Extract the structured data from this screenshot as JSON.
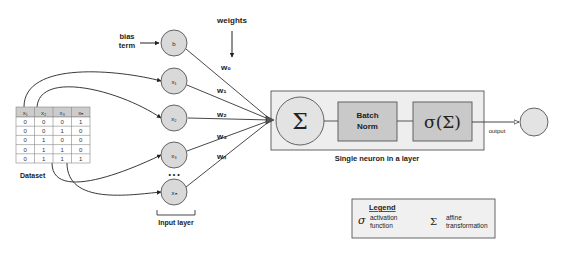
{
  "labels": {
    "weights": "weights",
    "bias_line1": "bias",
    "bias_line2": "term",
    "dataset": "Dataset",
    "input_layer": "Input layer",
    "neuron_caption": "Single neuron in a layer",
    "output": "output",
    "ellipsis": "• • •"
  },
  "input_nodes": [
    {
      "id": "b",
      "label": "b"
    },
    {
      "id": "x1",
      "label": "x₁"
    },
    {
      "id": "x2",
      "label": "x₂"
    },
    {
      "id": "x3",
      "label": "x₃"
    },
    {
      "id": "xn",
      "label": "xₙ"
    }
  ],
  "weights": [
    "w₀",
    "w₁",
    "w₂",
    "w₃",
    "wₙ"
  ],
  "neuron": {
    "sum_symbol": "Σ",
    "batch_norm_line1": "Batch",
    "batch_norm_line2": "Norm",
    "activation": "σ(Σ)"
  },
  "dataset_table": {
    "headers": [
      "x₁",
      "x₂",
      "x₃",
      "xₙ"
    ],
    "rows": [
      [
        "0",
        "0",
        "0",
        "1"
      ],
      [
        "0",
        "0",
        "1",
        "0"
      ],
      [
        "0",
        "1",
        "0",
        "0"
      ],
      [
        "0",
        "1",
        "1",
        "0"
      ],
      [
        "0",
        "1",
        "1",
        "1"
      ]
    ]
  },
  "legend": {
    "title": "Legend",
    "items": [
      {
        "symbol": "σ",
        "line1": "activation",
        "line2": "function"
      },
      {
        "symbol": "Σ",
        "line1": "affine",
        "line2": "transformation"
      }
    ]
  },
  "colors": {
    "node_fill": "#d9d9d9",
    "box_fill": "#eeeeee",
    "inner_box_fill": "#c9c9c9",
    "stroke": "#444444",
    "table_header": "#cccccc"
  }
}
